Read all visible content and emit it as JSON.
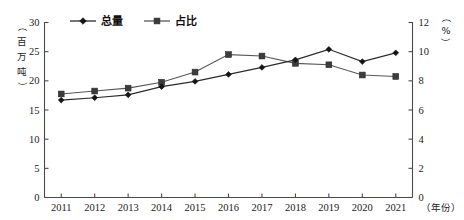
{
  "chart_data": {
    "type": "line",
    "title": "",
    "xlabel": "年份",
    "categories": [
      "2011",
      "2012",
      "2013",
      "2014",
      "2015",
      "2016",
      "2017",
      "2018",
      "2019",
      "2020",
      "2021"
    ],
    "series": [
      {
        "name": "总量",
        "axis": "left",
        "unit": "百万吨",
        "marker": "diamond",
        "color": "#141414",
        "values": [
          16.7,
          17.1,
          17.6,
          19.0,
          19.9,
          21.1,
          22.3,
          23.6,
          25.4,
          23.3,
          24.8
        ]
      },
      {
        "name": "占比",
        "axis": "right",
        "unit": "%",
        "marker": "square",
        "color": "#3c3c3c",
        "values": [
          7.1,
          7.3,
          7.5,
          7.9,
          8.6,
          9.8,
          9.7,
          9.2,
          9.1,
          8.4,
          8.3
        ]
      }
    ],
    "left_axis": {
      "label": "（百万吨）",
      "label_chars": [
        "（",
        "百",
        "万",
        "吨",
        "）"
      ],
      "ylim": [
        0,
        30
      ],
      "ticks": [
        0,
        5,
        10,
        15,
        20,
        25,
        30
      ],
      "tick_labels": [
        "0",
        "5",
        "10",
        "15",
        "20",
        "25",
        "30"
      ]
    },
    "right_axis": {
      "label": "（%）",
      "unit_symbol": "%",
      "ylim": [
        0,
        12
      ],
      "ticks": [
        0,
        2,
        4,
        6,
        8,
        10,
        12
      ],
      "tick_labels": [
        "0",
        "2",
        "4",
        "6",
        "8",
        "10",
        "12"
      ]
    },
    "x_axis": {
      "label": "（年份）",
      "tick_labels": [
        "2011",
        "2012",
        "2013",
        "2014",
        "2015",
        "2016",
        "2017",
        "2018",
        "2019",
        "2020",
        "2021"
      ]
    },
    "legend": {
      "position": "top-center",
      "entries": [
        {
          "label": "总量",
          "marker": "diamond"
        },
        {
          "label": "占比",
          "marker": "square"
        }
      ]
    },
    "grid": false
  }
}
